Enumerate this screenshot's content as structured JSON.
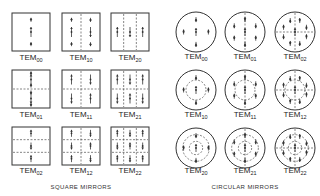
{
  "square": {
    "caption": "SQUARE MIRRORS",
    "modes": [
      {
        "name": "TEM",
        "sub": "00"
      },
      {
        "name": "TEM",
        "sub": "10"
      },
      {
        "name": "TEM",
        "sub": "20"
      },
      {
        "name": "TEM",
        "sub": "01"
      },
      {
        "name": "TEM",
        "sub": "11"
      },
      {
        "name": "TEM",
        "sub": "21"
      },
      {
        "name": "TEM",
        "sub": "02"
      },
      {
        "name": "TEM",
        "sub": "12"
      },
      {
        "name": "TEM",
        "sub": "22"
      }
    ]
  },
  "circular": {
    "caption": "CIRCULAR MIRRORS",
    "modes": [
      {
        "name": "TEM",
        "sub": "00"
      },
      {
        "name": "TEM",
        "sub": "01"
      },
      {
        "name": "TEM",
        "sub": "02"
      },
      {
        "name": "TEM",
        "sub": "10"
      },
      {
        "name": "TEM",
        "sub": "11"
      },
      {
        "name": "TEM",
        "sub": "12"
      },
      {
        "name": "TEM",
        "sub": "20"
      },
      {
        "name": "TEM",
        "sub": "21"
      },
      {
        "name": "TEM",
        "sub": "22"
      }
    ]
  },
  "colors": {
    "stroke": "#333333",
    "background": "#ffffff"
  }
}
